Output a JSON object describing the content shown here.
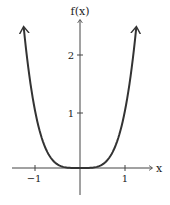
{
  "chart_data": {
    "type": "line",
    "title": "",
    "function": "f(x) = x^4",
    "xlabel": "x",
    "ylabel": "f(x)",
    "xlim": [
      -1.3,
      1.3
    ],
    "ylim": [
      -0.5,
      2.6
    ],
    "x_ticks": [
      -1,
      1
    ],
    "x_tick_labels": [
      "−1",
      "1"
    ],
    "y_ticks": [
      1,
      2
    ],
    "y_tick_labels": [
      "1",
      "2"
    ],
    "grid": false,
    "legend": null,
    "series": [
      {
        "name": "f(x)",
        "x": [
          -1.25,
          -1.0,
          -0.75,
          -0.5,
          -0.25,
          0,
          0.25,
          0.5,
          0.75,
          1.0,
          1.25
        ],
        "y": [
          2.44,
          1.0,
          0.32,
          0.06,
          0.004,
          0,
          0.004,
          0.06,
          0.32,
          1.0,
          2.44
        ],
        "arrows_at_ends": true
      }
    ],
    "colors": {
      "curve": "#333333",
      "axes": "#333333",
      "background": "#ffffff"
    }
  },
  "labels": {
    "x_axis": "x",
    "y_axis": "f(x)",
    "tick_x_neg1": "−1",
    "tick_x_1": "1",
    "tick_y_1": "1",
    "tick_y_2": "2"
  }
}
